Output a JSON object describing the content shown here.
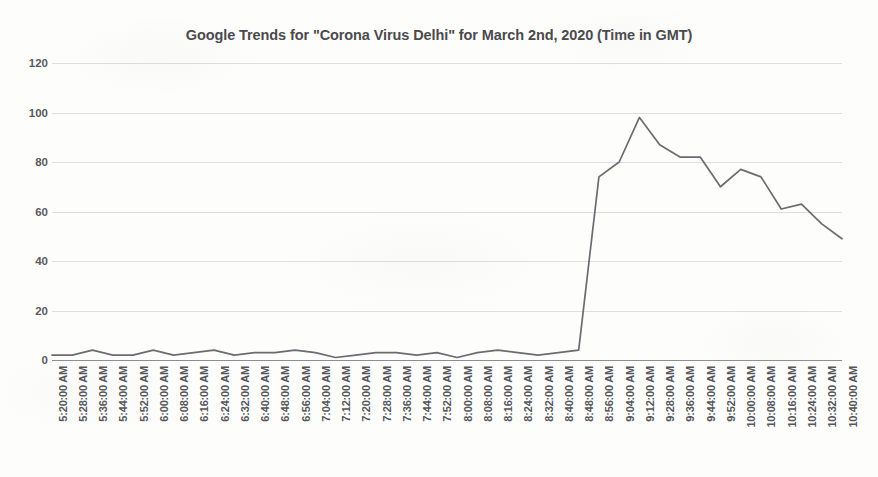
{
  "chart_data": {
    "type": "line",
    "title": "Google Trends for \"Corona Virus Delhi\" for March 2nd, 2020 (Time in GMT)",
    "xlabel": "",
    "ylabel": "",
    "ylim": [
      0,
      120
    ],
    "yticks": [
      0,
      20,
      40,
      60,
      80,
      100,
      120
    ],
    "grid": true,
    "legend": false,
    "line_color": "#6b6b70",
    "categories": [
      "5:20:00 AM",
      "5:28:00 AM",
      "5:36:00 AM",
      "5:44:00 AM",
      "5:52:00 AM",
      "6:00:00 AM",
      "6:08:00 AM",
      "6:16:00 AM",
      "6:24:00 AM",
      "6:32:00 AM",
      "6:40:00 AM",
      "6:48:00 AM",
      "6:56:00 AM",
      "7:04:00 AM",
      "7:12:00 AM",
      "7:20:00 AM",
      "7:28:00 AM",
      "7:36:00 AM",
      "7:44:00 AM",
      "7:52:00 AM",
      "8:00:00 AM",
      "8:08:00 AM",
      "8:16:00 AM",
      "8:24:00 AM",
      "8:32:00 AM",
      "8:40:00 AM",
      "8:48:00 AM",
      "8:56:00 AM",
      "9:04:00 AM",
      "9:12:00 AM",
      "9:28:00 AM",
      "9:36:00 AM",
      "9:44:00 AM",
      "9:52:00 AM",
      "10:00:00 AM",
      "10:08:00 AM",
      "10:16:00 AM",
      "10:24:00 AM",
      "10:32:00 AM",
      "10:40:00 AM"
    ],
    "values": [
      2,
      2,
      4,
      2,
      2,
      4,
      2,
      3,
      4,
      2,
      3,
      3,
      4,
      3,
      1,
      2,
      3,
      3,
      2,
      3,
      1,
      3,
      4,
      3,
      2,
      3,
      4,
      74,
      80,
      98,
      87,
      82,
      82,
      70,
      77,
      74,
      61,
      63,
      55,
      49
    ],
    "series_name": "Corona Virus Delhi"
  }
}
